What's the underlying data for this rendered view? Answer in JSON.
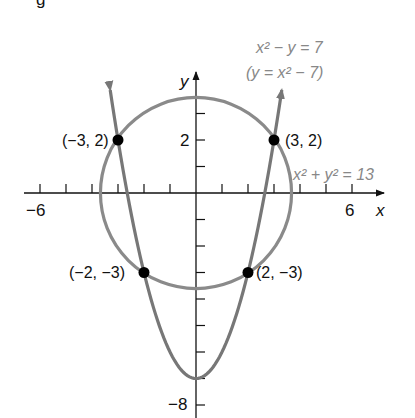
{
  "figure": {
    "partial_caption_glyph": "g"
  },
  "axes": {
    "x_label": "x",
    "y_label": "y",
    "x_tick_labels": [
      {
        "value": -6,
        "text": "−6"
      },
      {
        "value": 6,
        "text": "6"
      }
    ],
    "y_tick_labels": [
      {
        "value": 2,
        "text": "2"
      },
      {
        "value": -8,
        "text": "−8"
      }
    ],
    "x_range": [
      -6.0,
      7.0
    ],
    "y_range": [
      -8.5,
      4.6
    ]
  },
  "curves": {
    "parabola": {
      "label_line1": "x² − y = 7",
      "label_line2": "(y = x² − 7)",
      "color": "#777777"
    },
    "circle": {
      "label": "x² + y² = 13",
      "color": "#8a8a8a"
    }
  },
  "points": [
    {
      "x": -3,
      "y": 2,
      "label": "(−3, 2)"
    },
    {
      "x": 3,
      "y": 2,
      "label": "(3, 2)"
    },
    {
      "x": -2,
      "y": -3,
      "label": "(−2, −3)"
    },
    {
      "x": 2,
      "y": -3,
      "label": "(2, −3)"
    }
  ],
  "chart_data": {
    "type": "line",
    "title": "",
    "xlabel": "x",
    "ylabel": "y",
    "xlim": [
      -6,
      7
    ],
    "ylim": [
      -8.5,
      4.6
    ],
    "series": [
      {
        "name": "x² − y = 7 (y = x² − 7)",
        "kind": "parabola",
        "equation": "y = x^2 - 7"
      },
      {
        "name": "x² + y² = 13",
        "kind": "circle",
        "center": [
          0,
          0
        ],
        "radius": 3.606
      }
    ],
    "intersections": [
      [
        -3,
        2
      ],
      [
        3,
        2
      ],
      [
        -2,
        -3
      ],
      [
        2,
        -3
      ]
    ],
    "x_ticks": [
      -6,
      -5,
      -4,
      -3,
      -2,
      -1,
      1,
      2,
      3,
      4,
      5,
      6
    ],
    "y_ticks": [
      -8,
      -7,
      -6,
      -5,
      -4,
      -3,
      -2,
      -1,
      1,
      2,
      3
    ]
  }
}
